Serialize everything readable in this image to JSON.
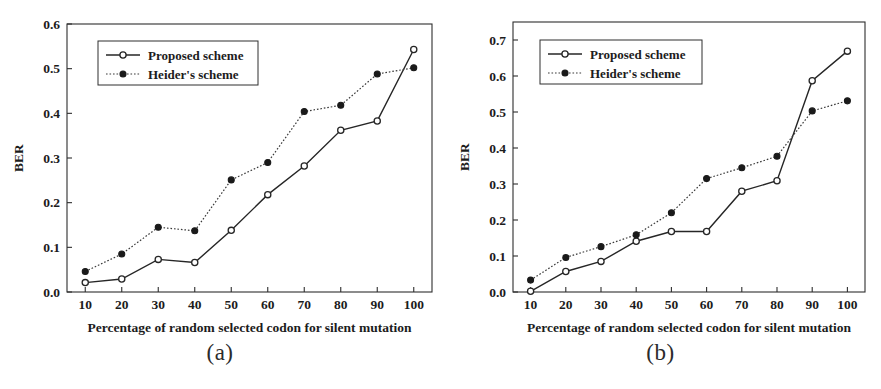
{
  "figure": {
    "panels": [
      {
        "caption": "(a)",
        "axis_title_y": "BER",
        "axis_title_x": "Percentage of random selected codon for silent mutation",
        "y_ticks": [
          "0.0",
          "0.1",
          "0.2",
          "0.3",
          "0.4",
          "0.5",
          "0.6"
        ],
        "x_ticks": [
          "10",
          "20",
          "30",
          "40",
          "50",
          "60",
          "70",
          "80",
          "90",
          "100"
        ],
        "legend": [
          "Proposed scheme",
          "Heider's scheme"
        ]
      },
      {
        "caption": "(b)",
        "axis_title_y": "BER",
        "axis_title_x": "Percentage of random selected codon for silent mutation",
        "y_ticks": [
          "0.0",
          "0.1",
          "0.2",
          "0.3",
          "0.4",
          "0.5",
          "0.6",
          "0.7"
        ],
        "x_ticks": [
          "10",
          "20",
          "30",
          "40",
          "50",
          "60",
          "70",
          "80",
          "90",
          "100"
        ],
        "legend": [
          "Proposed scheme",
          "Heider's scheme"
        ]
      }
    ]
  },
  "chart_data": [
    {
      "type": "line",
      "panel": "(a)",
      "title": "",
      "xlabel": "Percentage of random selected codon for silent mutation",
      "ylabel": "BER",
      "x": [
        10,
        20,
        30,
        40,
        50,
        60,
        70,
        80,
        90,
        100
      ],
      "xlim": [
        5,
        105
      ],
      "ylim": [
        0.0,
        0.6
      ],
      "grid": false,
      "legend_position": "upper-left",
      "series": [
        {
          "name": "Proposed scheme",
          "marker": "open-circle",
          "linestyle": "solid",
          "values": [
            0.021,
            0.029,
            0.073,
            0.066,
            0.138,
            0.218,
            0.282,
            0.362,
            0.383,
            0.543
          ]
        },
        {
          "name": "Heider's scheme",
          "marker": "filled-circle",
          "linestyle": "dotted",
          "values": [
            0.046,
            0.085,
            0.145,
            0.137,
            0.251,
            0.29,
            0.404,
            0.418,
            0.488,
            0.502
          ]
        }
      ]
    },
    {
      "type": "line",
      "panel": "(b)",
      "title": "",
      "xlabel": "Percentage of random selected codon for silent mutation",
      "ylabel": "BER",
      "x": [
        10,
        20,
        30,
        40,
        50,
        60,
        70,
        80,
        90,
        100
      ],
      "xlim": [
        5,
        105
      ],
      "ylim": [
        0.0,
        0.75
      ],
      "grid": false,
      "legend_position": "upper-left",
      "series": [
        {
          "name": "Proposed scheme",
          "marker": "open-circle",
          "linestyle": "solid",
          "values": [
            0.002,
            0.057,
            0.085,
            0.141,
            0.168,
            0.168,
            0.28,
            0.309,
            0.587,
            0.669
          ]
        },
        {
          "name": "Heider's scheme",
          "marker": "filled-circle",
          "linestyle": "dotted",
          "values": [
            0.033,
            0.096,
            0.126,
            0.159,
            0.22,
            0.315,
            0.345,
            0.377,
            0.503,
            0.531
          ]
        }
      ]
    }
  ]
}
